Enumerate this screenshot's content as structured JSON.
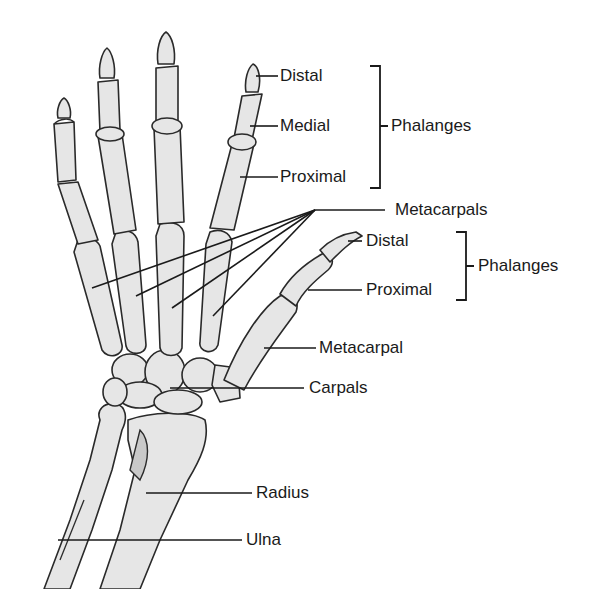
{
  "diagram": {
    "colors": {
      "bone_fill": "#e6e6e6",
      "bone_outline": "#2a2a2a",
      "label_text": "#1a1a1a",
      "background": "#ffffff"
    },
    "finger_labels": {
      "distal": "Distal",
      "medial": "Medial",
      "proximal": "Proximal",
      "group": "Phalanges"
    },
    "metacarpals_label": "Metacarpals",
    "thumb_labels": {
      "distal": "Distal",
      "proximal": "Proximal",
      "group": "Phalanges",
      "metacarpal": "Metacarpal"
    },
    "wrist_labels": {
      "carpals": "Carpals"
    },
    "forearm_labels": {
      "radius": "Radius",
      "ulna": "Ulna"
    }
  }
}
